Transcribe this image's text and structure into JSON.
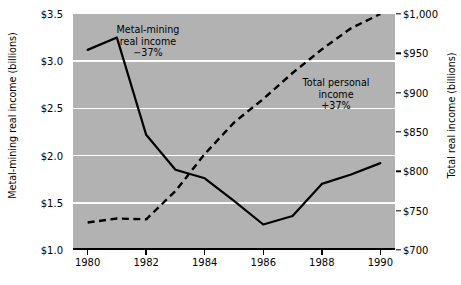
{
  "chart_data": {
    "type": "line",
    "title": "",
    "xlabel": "",
    "grid": "horizontal-white",
    "legend_position": "inline-annotations",
    "x": [
      1980,
      1981,
      1982,
      1983,
      1984,
      1985,
      1986,
      1987,
      1988,
      1989,
      1990
    ],
    "axes": {
      "x": {
        "ticks": [
          1980,
          1982,
          1984,
          1986,
          1988,
          1990
        ],
        "tick_labels": [
          "1980",
          "1982",
          "1984",
          "1986",
          "1988",
          "1990"
        ],
        "xlim": [
          1979.5,
          1990.5
        ]
      },
      "left": {
        "label": "Metal-mining real income (billions)",
        "ticks": [
          1.0,
          1.5,
          2.0,
          2.5,
          3.0,
          3.5
        ],
        "tick_labels": [
          "$1.0",
          "$1.5",
          "$2.0",
          "$2.5",
          "$3.0",
          "$3.5"
        ],
        "ylim": [
          1.0,
          3.5
        ]
      },
      "right": {
        "label": "Total real income (billions)",
        "ticks": [
          700,
          750,
          800,
          850,
          900,
          950,
          1000
        ],
        "tick_labels": [
          "$700",
          "$750",
          "$800",
          "$850",
          "$900",
          "$950",
          "$1,000"
        ],
        "ylim": [
          700,
          1000
        ]
      }
    },
    "series": [
      {
        "name": "Metal-mining real income",
        "style": "solid",
        "axis": "left",
        "color": "#000000",
        "values": [
          3.12,
          3.25,
          2.22,
          1.85,
          1.76,
          1.52,
          1.27,
          1.36,
          1.7,
          1.8,
          1.92
        ],
        "annotation": "Metal-mining\nreal income\n−37%"
      },
      {
        "name": "Total personal income",
        "style": "dashed",
        "axis": "right",
        "color": "#000000",
        "values": [
          735,
          740,
          739,
          775,
          822,
          862,
          892,
          925,
          955,
          982,
          1000
        ],
        "annotation": "Total personal\nincome\n+37%"
      }
    ],
    "colors": {
      "plot_background": "#b2b2b2",
      "gridline": "#ffffff",
      "axis": "#000000",
      "page_background": "#ffffff"
    }
  }
}
